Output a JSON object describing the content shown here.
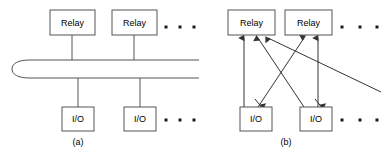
{
  "figure": {
    "stroke_color": "#555555",
    "arrow_color": "#333333",
    "background_color": "#ffffff"
  },
  "panels": [
    {
      "id": "a",
      "caption": "(a)",
      "caption_x": 78,
      "caption_y": 143,
      "topology": "shared-bus",
      "relays": [
        {
          "label": "Relay",
          "x": 50,
          "y": 10,
          "w": 45,
          "h": 25
        },
        {
          "label": "Relay",
          "x": 112,
          "y": 10,
          "w": 45,
          "h": 25
        }
      ],
      "io_nodes": [
        {
          "label": "I/O",
          "x": 62,
          "y": 107,
          "w": 32,
          "h": 24
        },
        {
          "label": "I/O",
          "x": 124,
          "y": 107,
          "w": 32,
          "h": 24
        }
      ],
      "bus": {
        "name": "shared-bus-ellipse",
        "left_cap_x": 12,
        "top_y": 60,
        "bottom_y": 78,
        "right_x": 199
      },
      "drop_lines": [
        {
          "x": 72,
          "y1": 35,
          "y2": 61
        },
        {
          "x": 134,
          "y1": 35,
          "y2": 61
        },
        {
          "x": 78,
          "y1": 77,
          "y2": 107
        },
        {
          "x": 140,
          "y1": 77,
          "y2": 107
        }
      ],
      "ellipsis_top": {
        "y": 27,
        "dots_x": [
          166,
          180,
          194
        ]
      },
      "ellipsis_bottom": {
        "y": 120,
        "dots_x": [
          166,
          180,
          194
        ]
      }
    },
    {
      "id": "b",
      "caption": "(b)",
      "caption_x": 286,
      "caption_y": 143,
      "topology": "point-to-point-arrows",
      "relays": [
        {
          "label": "Relay",
          "x": 228,
          "y": 10,
          "w": 47,
          "h": 25
        },
        {
          "label": "Relay",
          "x": 285,
          "y": 10,
          "w": 47,
          "h": 25
        }
      ],
      "io_nodes": [
        {
          "label": "I/O",
          "x": 240,
          "y": 107,
          "w": 32,
          "h": 24
        },
        {
          "label": "I/O",
          "x": 300,
          "y": 107,
          "w": 32,
          "h": 24
        }
      ],
      "arrows": [
        {
          "name": "io1-to-relay1",
          "x1": 244,
          "y1": 107,
          "x2": 244,
          "y2": 38
        },
        {
          "name": "io1-to-relay2",
          "x1": 258,
          "y1": 107,
          "x2": 304,
          "y2": 38
        },
        {
          "name": "io2-to-relay1",
          "x1": 304,
          "y1": 107,
          "x2": 258,
          "y2": 38
        },
        {
          "name": "io2-to-relay2",
          "x1": 318,
          "y1": 107,
          "x2": 318,
          "y2": 38
        },
        {
          "name": "far-node-to-relay1",
          "x1": 381,
          "y1": 92,
          "x2": 268,
          "y2": 38
        }
      ],
      "io_inbound_stubs": [
        {
          "name": "stub-into-io1",
          "x1": 255,
          "y1": 100,
          "x2": 262,
          "y2": 107
        },
        {
          "name": "stub-into-io2",
          "x1": 315,
          "y1": 100,
          "x2": 322,
          "y2": 107
        }
      ],
      "ellipsis_top": {
        "y": 27,
        "dots_x": [
          342,
          360,
          377
        ]
      },
      "ellipsis_bottom": {
        "y": 120,
        "dots_x": [
          342,
          360,
          377
        ]
      }
    }
  ]
}
